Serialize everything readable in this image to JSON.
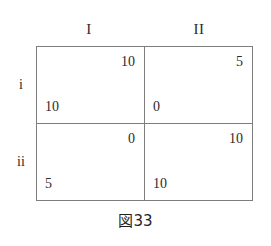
{
  "figure": {
    "caption": "図33",
    "line_color": "#7e7e7e",
    "text_color": "#2b2b2b",
    "background_color": "#ffffff"
  },
  "matrix": {
    "column_headers": [
      {
        "label": "I"
      },
      {
        "label": "II"
      }
    ],
    "row_headers": [
      {
        "label": "i"
      },
      {
        "label": "ii"
      }
    ],
    "cells": [
      [
        {
          "top_right": "10",
          "bottom_left": "10"
        },
        {
          "top_right": "5",
          "bottom_left": "0"
        }
      ],
      [
        {
          "top_right": "0",
          "bottom_left": "5"
        },
        {
          "top_right": "10",
          "bottom_left": "10"
        }
      ]
    ]
  },
  "chart_data": {
    "type": "table",
    "title": "図33",
    "xlabel": "",
    "ylabel": "",
    "categories": [
      "I",
      "II"
    ],
    "row_categories": [
      "i",
      "ii"
    ],
    "series": [
      {
        "name": "row-player payoff (bottom-left)",
        "values": [
          [
            10,
            0
          ],
          [
            5,
            10
          ]
        ]
      },
      {
        "name": "column-player payoff (top-right)",
        "values": [
          [
            10,
            5
          ],
          [
            0,
            10
          ]
        ]
      }
    ]
  }
}
